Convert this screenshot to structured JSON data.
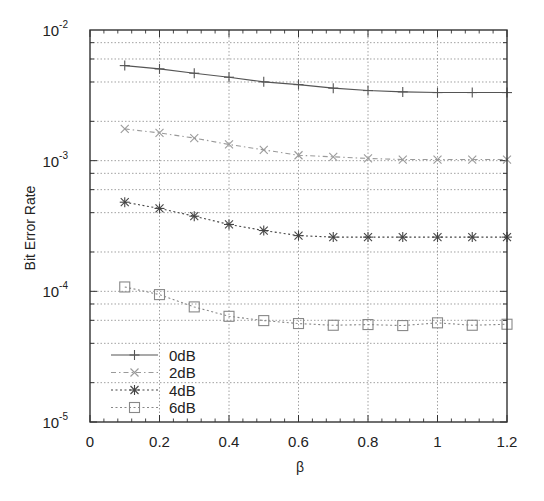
{
  "chart_data": {
    "type": "line",
    "title": "",
    "xlabel": "β",
    "ylabel": "Bit Error Rate",
    "xlim": [
      0,
      1.2
    ],
    "ylim": [
      1e-05,
      0.01
    ],
    "yscale": "log",
    "grid": true,
    "legend_position": "lower left",
    "x_ticks": [
      "0",
      "0.2",
      "0.4",
      "0.6",
      "0.8",
      "1",
      "1.2"
    ],
    "y_ticks": [
      {
        "base": "10",
        "exp": "-2"
      },
      {
        "base": "10",
        "exp": "-3"
      },
      {
        "base": "10",
        "exp": "-4"
      },
      {
        "base": "10",
        "exp": "-5"
      }
    ],
    "x": [
      0.1,
      0.2,
      0.3,
      0.4,
      0.5,
      0.6,
      0.7,
      0.8,
      0.9,
      1.0,
      1.1,
      1.2
    ],
    "series": [
      {
        "name": "0dB",
        "marker": "plus",
        "line": "solid",
        "color": "#555555",
        "values": [
          0.00534,
          0.00504,
          0.00467,
          0.00435,
          0.00401,
          0.00382,
          0.00359,
          0.00344,
          0.00336,
          0.00332,
          0.00332,
          0.00332
        ]
      },
      {
        "name": "2dB",
        "marker": "cross",
        "line": "dashdot",
        "color": "#9a9a9a",
        "values": [
          0.00175,
          0.00163,
          0.00149,
          0.00133,
          0.00121,
          0.0011,
          0.00107,
          0.00104,
          0.00102,
          0.00102,
          0.00102,
          0.00102
        ]
      },
      {
        "name": "4dB",
        "marker": "star",
        "line": "dotted",
        "color": "#444444",
        "values": [
          0.000481,
          0.000431,
          0.000376,
          0.000325,
          0.000292,
          0.000267,
          0.00026,
          0.00026,
          0.00026,
          0.00026,
          0.00026,
          0.00026
        ]
      },
      {
        "name": "6dB",
        "marker": "square",
        "line": "dotted",
        "color": "#888888",
        "values": [
          0.000108,
          9.44e-05,
          7.6e-05,
          6.44e-05,
          5.97e-05,
          5.67e-05,
          5.5e-05,
          5.57e-05,
          5.47e-05,
          5.74e-05,
          5.5e-05,
          5.6e-05
        ]
      }
    ]
  }
}
